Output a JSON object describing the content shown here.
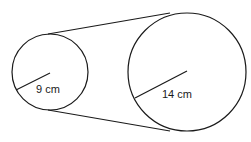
{
  "diagram": {
    "type": "two circles joined by external tangent lines (belt/pulley)",
    "stroke_color": "#1a1a1a",
    "background": "#ffffff",
    "small_circle": {
      "radius_label": "9 cm",
      "center": [
        50,
        72
      ],
      "radius_px": 38,
      "radius_line_end": [
        16,
        90
      ]
    },
    "large_circle": {
      "radius_label": "14 cm",
      "center": [
        187,
        72
      ],
      "radius_px": 59,
      "radius_line_end": [
        134,
        98
      ]
    },
    "tangent_lines": [
      {
        "name": "top",
        "from": [
          48,
          34
        ],
        "to": [
          170,
          13
        ]
      },
      {
        "name": "bottom",
        "from": [
          48,
          110
        ],
        "to": [
          170,
          131
        ]
      }
    ]
  }
}
